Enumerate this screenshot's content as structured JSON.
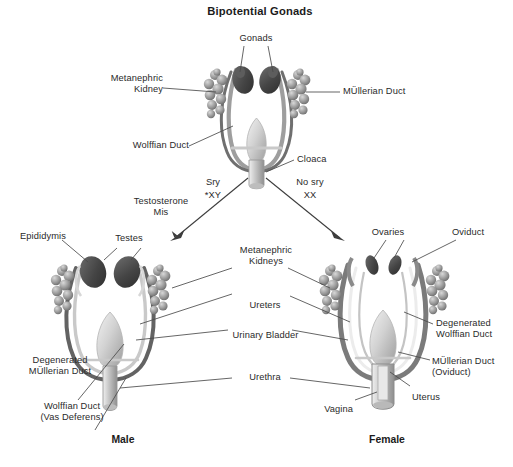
{
  "figure": {
    "title": "Bipotential Gonads",
    "background_color": "#ffffff",
    "line_color": "#3a3a3a",
    "gonad_color": "#4c4c4c",
    "kidney_color": "#8e8e8e",
    "duct_color": "#7d7d7d"
  },
  "top_panel": {
    "title": "Bipotential Gonads",
    "labels": {
      "gonads": "Gonads",
      "metanephric_kidney": "Metanephric\nKidney",
      "mullerian_duct": "MÜllerian Duct",
      "wolffian_duct": "Wolffian Duct",
      "cloaca": "Cloaca"
    }
  },
  "branches": {
    "male": {
      "gene": "Sry",
      "karyotype": "XY",
      "marker": "*"
    },
    "female": {
      "gene": "No sry",
      "karyotype": "XX"
    },
    "hormones": "Testosterone\nMis"
  },
  "male_panel": {
    "sex_label": "Male",
    "labels": {
      "epididymis": "Epididymis",
      "testes": "Testes",
      "degenerated_mullerian_duct": "Degenerated\nMÜllerian Duct",
      "wolffian_duct": "Wolffian Duct\n(Vas Deferens)"
    }
  },
  "female_panel": {
    "sex_label": "Female",
    "labels": {
      "ovaries": "Ovaries",
      "oviduct": "Oviduct",
      "degenerated_wolffian_duct": "Degenerated\nWolffian Duct",
      "mullerian_duct": "MÜllerian Duct\n(Oviduct)",
      "uterus": "Uterus",
      "vagina": "Vagina"
    }
  },
  "center_labels": {
    "metanephric_kidneys": "Metanephric\nKidneys",
    "ureters": "Ureters",
    "urinary_bladder": "Urinary Bladder",
    "urethra": "Urethra"
  }
}
